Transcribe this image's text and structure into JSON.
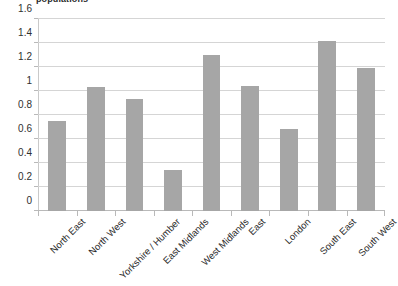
{
  "chart_data": {
    "type": "bar",
    "title": "populations",
    "xlabel": "",
    "ylabel": "",
    "categories": [
      "North East",
      "North West",
      "Yorkshire / Humber",
      "East Midlands",
      "West Midlands",
      "East",
      "London",
      "South East",
      "South West"
    ],
    "values": [
      0.75,
      1.03,
      0.93,
      0.34,
      1.3,
      1.04,
      0.68,
      1.42,
      1.19
    ],
    "ylim": [
      0,
      1.6
    ],
    "ytick_labels": [
      "0",
      "0.2",
      "0.4",
      "0.6",
      "0.8",
      "1",
      "1.2",
      "1.4",
      "1.6"
    ],
    "ytick_values": [
      0,
      0.2,
      0.4,
      0.6,
      0.8,
      1.0,
      1.2,
      1.4,
      1.6
    ],
    "grid": true,
    "legend": false,
    "legend_position": "none",
    "series": [
      {
        "name": "populations",
        "color": "#a6a6a6",
        "values": [
          0.75,
          1.03,
          0.93,
          0.34,
          1.3,
          1.04,
          0.68,
          1.42,
          1.19
        ]
      }
    ]
  },
  "colors": {
    "bar": "#a6a6a6",
    "gridline": "#d5d5d5",
    "axis": "#b9b9b9",
    "text": "#2b2b2b",
    "background": "#ffffff"
  }
}
